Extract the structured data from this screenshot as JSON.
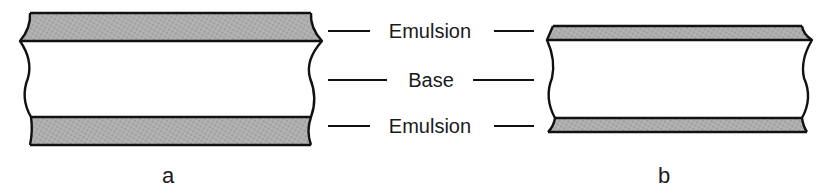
{
  "figure": {
    "labels": [
      {
        "text": "Emulsion",
        "y": 30
      },
      {
        "text": "Base",
        "y": 78
      },
      {
        "text": "Emulsion",
        "y": 125
      }
    ],
    "panels": [
      {
        "caption": "a",
        "description": "Film cross-section with thick emulsion layers"
      },
      {
        "caption": "b",
        "description": "Film cross-section with thin emulsion layers"
      }
    ],
    "colors": {
      "emulsion_fill": "#a8a8a8",
      "base_fill": "#ffffff",
      "outline": "#111111"
    }
  }
}
